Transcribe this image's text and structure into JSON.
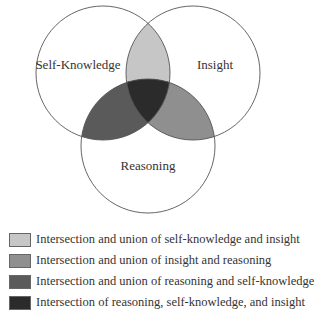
{
  "diagram": {
    "type": "venn",
    "circles": [
      {
        "id": "self_knowledge",
        "label": "Self-Knowledge",
        "cx": 103,
        "cy": 73,
        "r": 67,
        "label_x": 78,
        "label_y": 69
      },
      {
        "id": "insight",
        "label": "Insight",
        "cx": 193,
        "cy": 73,
        "r": 67,
        "label_x": 215,
        "label_y": 69
      },
      {
        "id": "reasoning",
        "label": "Reasoning",
        "cx": 148,
        "cy": 146,
        "r": 67,
        "label_x": 148,
        "label_y": 170
      }
    ],
    "regions": {
      "self_knowledge_insight": "#c6c6c6",
      "insight_reasoning": "#8f8f8f",
      "reasoning_self_knowledge": "#5a5a5a",
      "all_three": "#2b2b2b"
    },
    "stroke": "#555555"
  },
  "legend": {
    "items": [
      {
        "color": "#c6c6c6",
        "label": "Intersection and union of self-knowledge and insight"
      },
      {
        "color": "#8f8f8f",
        "label": "Intersection and union of insight and reasoning"
      },
      {
        "color": "#5a5a5a",
        "label": "Intersection and union of reasoning and self-knowledge"
      },
      {
        "color": "#2b2b2b",
        "label": "Intersection of reasoning, self-knowledge, and insight"
      }
    ]
  }
}
